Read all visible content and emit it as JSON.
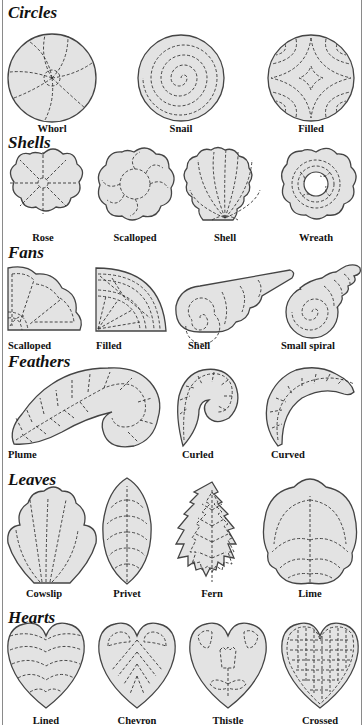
{
  "colors": {
    "fill": "#e3e3e3",
    "outline": "#444444",
    "stitch": "#333333",
    "background": "#ffffff"
  },
  "sections": [
    {
      "title": "Circles",
      "items": [
        {
          "label": "Whorl"
        },
        {
          "label": "Snail"
        },
        {
          "label": "Filled"
        }
      ]
    },
    {
      "title": "Shells",
      "items": [
        {
          "label": "Rose"
        },
        {
          "label": "Scalloped"
        },
        {
          "label": "Shell"
        },
        {
          "label": "Wreath"
        }
      ]
    },
    {
      "title": "Fans",
      "items": [
        {
          "label": "Scalloped"
        },
        {
          "label": "Filled"
        },
        {
          "label": "Shell"
        },
        {
          "label": "Small spiral"
        }
      ]
    },
    {
      "title": "Feathers",
      "items": [
        {
          "label": "Plume"
        },
        {
          "label": "Curled"
        },
        {
          "label": "Curved"
        }
      ]
    },
    {
      "title": "Leaves",
      "items": [
        {
          "label": "Cowslip"
        },
        {
          "label": "Privet"
        },
        {
          "label": "Fern"
        },
        {
          "label": "Lime"
        }
      ]
    },
    {
      "title": "Hearts",
      "items": [
        {
          "label": "Lined"
        },
        {
          "label": "Chevron"
        },
        {
          "label": "Thistle"
        },
        {
          "label": "Crossed"
        }
      ]
    }
  ]
}
